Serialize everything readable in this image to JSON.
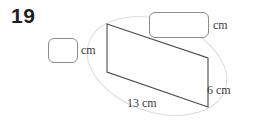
{
  "question": {
    "number": "19"
  },
  "answers": [
    {
      "name": "slant-height-box",
      "value": "",
      "unit": "cm"
    },
    {
      "name": "top-length-box",
      "value": "",
      "unit": "cm"
    }
  ],
  "figure": {
    "shape": "parallelogram",
    "guide_shape": "ellipse",
    "stroke_color": "#4a4a4a",
    "guide_color": "#d8d8d8",
    "labels": {
      "base": "13 cm",
      "right_side": "6 cm"
    },
    "vertices": {
      "top_left": [
        107,
        24
      ],
      "top_right": [
        208,
        58
      ],
      "bottom_right": [
        208,
        107
      ],
      "bottom_left": [
        107,
        72
      ]
    }
  }
}
